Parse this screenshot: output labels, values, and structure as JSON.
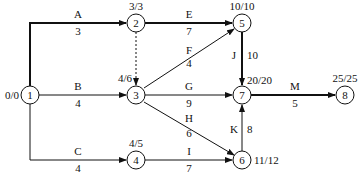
{
  "diagram": {
    "type": "activity-on-arrow network",
    "nodes": [
      {
        "id": "1",
        "label": "1",
        "times": "0/0"
      },
      {
        "id": "2",
        "label": "2",
        "times": "3/3"
      },
      {
        "id": "3",
        "label": "3",
        "times": "4/6"
      },
      {
        "id": "4",
        "label": "4",
        "times": "4/5"
      },
      {
        "id": "5",
        "label": "5",
        "times": "10/10"
      },
      {
        "id": "6",
        "label": "6",
        "times": "11/12"
      },
      {
        "id": "7",
        "label": "7",
        "times": "20/20"
      },
      {
        "id": "8",
        "label": "8",
        "times": "25/25"
      }
    ],
    "activities": [
      {
        "name": "A",
        "duration": "3",
        "from": "1",
        "to": "2",
        "critical": true
      },
      {
        "name": "B",
        "duration": "4",
        "from": "1",
        "to": "3",
        "critical": false
      },
      {
        "name": "C",
        "duration": "4",
        "from": "1",
        "to": "4",
        "critical": false
      },
      {
        "name": "E",
        "duration": "7",
        "from": "2",
        "to": "5",
        "critical": true
      },
      {
        "name": "F",
        "duration": "4",
        "from": "3",
        "to": "5",
        "critical": false
      },
      {
        "name": "G",
        "duration": "9",
        "from": "3",
        "to": "7",
        "critical": false
      },
      {
        "name": "H",
        "duration": "6",
        "from": "3",
        "to": "6",
        "critical": false
      },
      {
        "name": "I",
        "duration": "7",
        "from": "4",
        "to": "6",
        "critical": false
      },
      {
        "name": "J",
        "duration": "10",
        "from": "5",
        "to": "7",
        "critical": true
      },
      {
        "name": "K",
        "duration": "8",
        "from": "6",
        "to": "7",
        "critical": false
      },
      {
        "name": "M",
        "duration": "5",
        "from": "7",
        "to": "8",
        "critical": true
      }
    ],
    "dummy": {
      "from": "2",
      "to": "3",
      "style": "dashed"
    }
  }
}
